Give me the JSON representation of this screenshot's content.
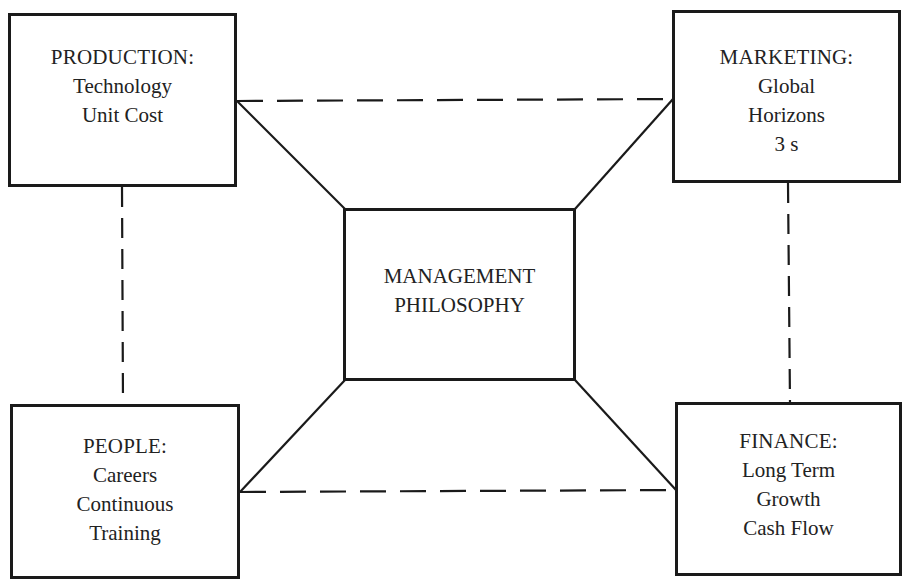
{
  "diagram": {
    "type": "hub-and-spoke organizational diagram",
    "colors": {
      "line": "#1a1a1a",
      "text": "#222222",
      "background": "#ffffff"
    },
    "center": {
      "id": "management",
      "lines": [
        "MANAGEMENT",
        "PHILOSOPHY"
      ]
    },
    "nodes": [
      {
        "id": "production",
        "position": "top-left",
        "title": "PRODUCTION:",
        "items": [
          "Technology",
          "Unit Cost"
        ]
      },
      {
        "id": "marketing",
        "position": "top-right",
        "title": "MARKETING:",
        "items": [
          "Global",
          "Horizons",
          "3 s"
        ]
      },
      {
        "id": "people",
        "position": "bottom-left",
        "title": "PEOPLE:",
        "items": [
          "Careers",
          "Continuous",
          "Training"
        ]
      },
      {
        "id": "finance",
        "position": "bottom-right",
        "title": "FINANCE:",
        "items": [
          "Long Term",
          "Growth",
          "Cash Flow"
        ]
      }
    ],
    "connections": {
      "solid": [
        [
          "production",
          "management"
        ],
        [
          "marketing",
          "management"
        ],
        [
          "people",
          "management"
        ],
        [
          "finance",
          "management"
        ]
      ],
      "dashed": [
        [
          "production",
          "marketing"
        ],
        [
          "people",
          "finance"
        ],
        [
          "production",
          "people"
        ],
        [
          "marketing",
          "finance"
        ]
      ]
    }
  }
}
